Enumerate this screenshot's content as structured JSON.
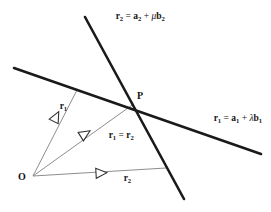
{
  "figure": {
    "background_color": "#ffffff",
    "thick_line_color": "#1a1a1a",
    "thin_line_color": "#808080",
    "text_color": "#141414",
    "width": 271,
    "height": 212
  },
  "labels": {
    "line2_equation": {
      "r": "r",
      "r_sub": "2",
      "equals": " = ",
      "a": "a",
      "a_sub": "2",
      "plus": " + ",
      "mu": "μ",
      "b": "b",
      "b_sub": "2",
      "plain": "r2 = a2 + μb2"
    },
    "line1_equation": {
      "r": "r",
      "r_sub": "1",
      "equals": " = ",
      "a": "a",
      "a_sub": "1",
      "plus": " + ",
      "lambda": "λ",
      "b": "b",
      "b_sub": "1",
      "plain": "r1 = a1 + λb1"
    },
    "point_p": "P",
    "origin_o": "O",
    "vector_r1": {
      "r": "r",
      "sub": "1",
      "plain": "r1"
    },
    "vector_r2": {
      "r": "r",
      "sub": "2",
      "plain": "r2"
    },
    "vector_equal": {
      "r_a": "r",
      "sub_a": "1",
      "equals": " = ",
      "r_b": "r",
      "sub_b": "2",
      "plain": "r1 = r2"
    }
  },
  "geometry": {
    "line1": {
      "name": "line-r1",
      "x1": 14,
      "y1": 68,
      "x2": 261,
      "y2": 154,
      "width": 2.6
    },
    "line2": {
      "name": "line-r2",
      "x1": 85,
      "y1": 17,
      "x2": 184,
      "y2": 199,
      "width": 2.6
    },
    "origin": {
      "x": 33,
      "y": 176
    },
    "point_p": {
      "x": 133,
      "y": 104
    },
    "foot_r1": {
      "x": 77,
      "y": 90
    },
    "foot_r2": {
      "x": 166,
      "y": 168
    },
    "thin_width": 0.9
  },
  "arrowheads": [
    {
      "name": "arrowhead-r1",
      "x": 56,
      "y": 117,
      "angle": -62,
      "label": "r1"
    },
    {
      "name": "arrowhead-r1-equals-r2",
      "x": 85,
      "y": 134,
      "angle": -28,
      "label": "r1 = r2"
    },
    {
      "name": "arrowhead-r2",
      "x": 100,
      "y": 173,
      "angle": -3,
      "label": "r2"
    }
  ]
}
